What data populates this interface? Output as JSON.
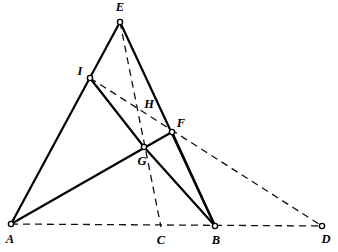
{
  "figure": {
    "width": 338,
    "height": 252,
    "background_color": "#ffffff",
    "line_color": "#000000",
    "dash_color": "#111111",
    "solid_stroke_width": 2.2,
    "dashed_stroke_width": 1.3,
    "dash_pattern": "7 5",
    "vertex_radius": 2.6
  },
  "points": [
    {
      "id": "A",
      "label": "A",
      "x": 11,
      "y": 224,
      "marker": "circle",
      "label_x": 10,
      "label_y": 240
    },
    {
      "id": "B",
      "label": "B",
      "x": 215,
      "y": 226,
      "marker": "circle",
      "label_x": 216,
      "label_y": 241
    },
    {
      "id": "C",
      "label": "C",
      "x": 161,
      "y": 227,
      "marker": "none",
      "label_x": 161,
      "label_y": 241
    },
    {
      "id": "D",
      "label": "D",
      "x": 322,
      "y": 226,
      "marker": "circle",
      "label_x": 326,
      "label_y": 240
    },
    {
      "id": "E",
      "label": "E",
      "x": 120,
      "y": 22,
      "marker": "circle",
      "label_x": 120,
      "label_y": 8
    },
    {
      "id": "F",
      "label": "F",
      "x": 172,
      "y": 132,
      "marker": "circle",
      "label_x": 181,
      "label_y": 124
    },
    {
      "id": "G",
      "label": "G",
      "x": 144,
      "y": 147,
      "marker": "circle",
      "label_x": 142,
      "label_y": 162
    },
    {
      "id": "H",
      "label": "H",
      "x": 139,
      "y": 113,
      "marker": "none",
      "label_x": 149,
      "label_y": 105
    },
    {
      "id": "I",
      "label": "I",
      "x": 90,
      "y": 78,
      "marker": "circle",
      "label_x": 80,
      "label_y": 72
    }
  ],
  "segments": [
    {
      "id": "seg-A-E",
      "from": "A",
      "to": "E",
      "style": "solid",
      "note": "side through I"
    },
    {
      "id": "seg-E-B",
      "from": "E",
      "to": "B",
      "style": "solid",
      "note": "side through F"
    },
    {
      "id": "seg-A-F",
      "from": "A",
      "to": "F",
      "style": "solid",
      "note": "cevian through G"
    },
    {
      "id": "seg-I-G",
      "from": "I",
      "to": "G",
      "style": "solid",
      "note": "cevian toward B"
    },
    {
      "id": "seg-G-B",
      "from": "G",
      "to": "B",
      "style": "solid",
      "note": "continuation of I-G"
    },
    {
      "id": "seg-F-B",
      "from": "F",
      "to": "B",
      "style": "solid",
      "note": "lower part of E-B"
    },
    {
      "id": "seg-A-D",
      "from": "A",
      "to": "D",
      "style": "dashed",
      "note": "base line through C and B"
    },
    {
      "id": "seg-E-C",
      "from": "E",
      "to": "C",
      "style": "dashed",
      "note": "median through H and G"
    },
    {
      "id": "seg-I-D",
      "from": "I",
      "to": "D",
      "style": "dashed",
      "note": "transversal through H and F"
    }
  ],
  "intersections": [
    {
      "id": "H",
      "of": [
        "seg-E-C",
        "seg-I-D"
      ]
    },
    {
      "id": "G",
      "of": [
        "seg-A-F",
        "seg-I-G",
        "seg-E-C"
      ]
    },
    {
      "id": "F",
      "of": [
        "seg-E-B",
        "seg-A-F",
        "seg-I-D"
      ]
    },
    {
      "id": "C",
      "of": [
        "seg-A-D",
        "seg-E-C"
      ]
    }
  ]
}
